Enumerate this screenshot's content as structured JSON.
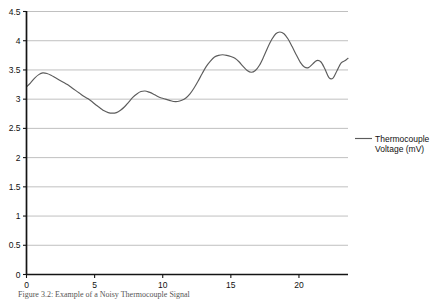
{
  "chart_data": {
    "type": "line",
    "title": "",
    "xlabel": "",
    "ylabel": "",
    "xlim": [
      0,
      23.6
    ],
    "ylim": [
      0,
      4.5
    ],
    "grid": true,
    "grid_axis": "y",
    "legend_position": "right",
    "series": [
      {
        "name": "Thermocouple Voltage (mV)",
        "color": "#5c5c5c",
        "x": [
          0.0,
          0.3,
          0.6,
          0.9,
          1.2,
          1.5,
          1.8,
          2.1,
          2.4,
          2.7,
          3.0,
          3.3,
          3.6,
          3.9,
          4.2,
          4.5,
          4.8,
          5.1,
          5.4,
          5.7,
          6.0,
          6.3,
          6.6,
          6.9,
          7.2,
          7.5,
          7.8,
          8.1,
          8.4,
          8.7,
          9.0,
          9.3,
          9.6,
          9.9,
          10.2,
          10.5,
          10.8,
          11.1,
          11.4,
          11.7,
          12.0,
          12.3,
          12.6,
          12.9,
          13.2,
          13.5,
          13.8,
          14.1,
          14.4,
          14.7,
          15.0,
          15.3,
          15.6,
          15.9,
          16.2,
          16.5,
          16.8,
          17.1,
          17.4,
          17.7,
          18.0,
          18.3,
          18.6,
          18.9,
          19.2,
          19.5,
          19.8,
          20.1,
          20.4,
          20.7,
          21.0,
          21.3,
          21.6,
          21.9,
          22.2,
          22.5,
          22.8,
          23.1,
          23.4,
          23.6
        ],
        "y": [
          3.21,
          3.28,
          3.36,
          3.42,
          3.45,
          3.44,
          3.41,
          3.37,
          3.33,
          3.29,
          3.25,
          3.2,
          3.15,
          3.1,
          3.05,
          3.01,
          2.96,
          2.9,
          2.85,
          2.8,
          2.77,
          2.76,
          2.77,
          2.81,
          2.87,
          2.95,
          3.03,
          3.09,
          3.13,
          3.14,
          3.12,
          3.09,
          3.05,
          3.02,
          3.0,
          2.98,
          2.96,
          2.96,
          2.98,
          3.02,
          3.09,
          3.19,
          3.31,
          3.44,
          3.56,
          3.65,
          3.72,
          3.75,
          3.76,
          3.75,
          3.73,
          3.7,
          3.64,
          3.56,
          3.49,
          3.46,
          3.49,
          3.58,
          3.72,
          3.88,
          4.02,
          4.12,
          4.15,
          4.12,
          4.03,
          3.9,
          3.76,
          3.63,
          3.55,
          3.54,
          3.6,
          3.66,
          3.64,
          3.52,
          3.37,
          3.36,
          3.49,
          3.62,
          3.66,
          3.7
        ],
        "y_secondary_detail": [
          3.21,
          3.45,
          2.76,
          3.14,
          2.96,
          3.76,
          3.46,
          4.15,
          3.54,
          3.36,
          3.7
        ]
      }
    ],
    "y_ticks": [
      0,
      0.5,
      1,
      1.5,
      2,
      2.5,
      3,
      3.5,
      4,
      4.5
    ],
    "y_tick_labels": [
      "0",
      "0.5",
      "1",
      "1.5",
      "2",
      "2.5",
      "3",
      "3.5",
      "4",
      "4.5"
    ],
    "x_ticks": [
      0,
      5,
      10,
      15,
      20
    ],
    "x_tick_labels": [
      "0",
      "5",
      "10",
      "15",
      "20"
    ],
    "annotations": []
  },
  "legend": {
    "entry_label_line1": "Thermocouple",
    "entry_label_line2": "Voltage (mV)",
    "swatch_color": "#5c5c5c"
  },
  "caption": {
    "text": "Figure 3.2: Example of a Noisy Thermocouple Signal"
  },
  "axes": {
    "y_label": "",
    "x_label": ""
  }
}
